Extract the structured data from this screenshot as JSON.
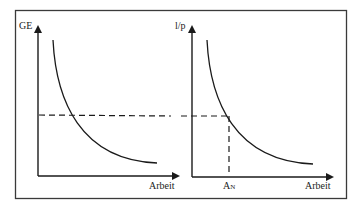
{
  "left_panel": {
    "y_label": "GE",
    "x_label": "Arbeit"
  },
  "right_panel": {
    "y_label": "l/p",
    "x_label": "Arbeit",
    "marker_label_main": "A",
    "marker_label_sub": "N"
  },
  "colors": {
    "line": "#2a2a2a",
    "frame": "#3a3a3a"
  }
}
